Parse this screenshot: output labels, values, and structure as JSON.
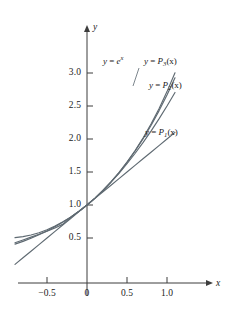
{
  "figure": {
    "background": "#ffffff",
    "curve_color": "#5f6a72",
    "axis_color": "#3d3d3d",
    "text_color": "#1b1b1b"
  },
  "axes": {
    "x_name": "x",
    "y_name": "y",
    "x_ticks": [
      {
        "value": -0.5,
        "label": "−0.5",
        "px": 47
      },
      {
        "value": 0,
        "label": "0",
        "px": 87
      },
      {
        "value": 0.5,
        "label": "0.5",
        "px": 127
      },
      {
        "value": 1.0,
        "label": "1.0",
        "px": 167
      }
    ],
    "y_ticks": [
      {
        "value": 0.5,
        "label": "0.5",
        "px": 238
      },
      {
        "value": 1.0,
        "label": "1.0",
        "px": 205
      },
      {
        "value": 1.5,
        "label": "1.5",
        "px": 172
      },
      {
        "value": 2.0,
        "label": "2.0",
        "px": 139
      },
      {
        "value": 2.5,
        "label": "2.5",
        "px": 106
      },
      {
        "value": 3.0,
        "label": "3.0",
        "px": 73
      }
    ]
  },
  "labels": {
    "exp": {
      "lhs": "y",
      "eq": "=",
      "base": "e",
      "exp": "x"
    },
    "p3": {
      "lhs": "y",
      "eq": "=",
      "fn": "P",
      "sub": "3",
      "arg": "(x)"
    },
    "p2": {
      "lhs": "y",
      "eq": "=",
      "fn": "P",
      "sub": "2",
      "arg": "(x)"
    },
    "p1": {
      "lhs": "y",
      "eq": "=",
      "fn": "P",
      "sub": "1",
      "arg": "(x)"
    }
  },
  "chart_data": {
    "type": "line",
    "title": "",
    "xlabel": "x",
    "ylabel": "y",
    "xlim": [
      -0.93,
      1.22
    ],
    "ylim": [
      0.0,
      3.25
    ],
    "grid": false,
    "legend": "inline-annotations",
    "x": [
      -0.9,
      -0.8,
      -0.7,
      -0.6,
      -0.5,
      -0.4,
      -0.3,
      -0.2,
      -0.1,
      0.0,
      0.1,
      0.2,
      0.3,
      0.4,
      0.5,
      0.6,
      0.7,
      0.8,
      0.9,
      1.0,
      1.1
    ],
    "series": [
      {
        "name": "y = e^x",
        "formula": "e^x",
        "color": "#5f6a72",
        "values": [
          0.407,
          0.449,
          0.497,
          0.549,
          0.607,
          0.67,
          0.741,
          0.819,
          0.905,
          1.0,
          1.105,
          1.221,
          1.35,
          1.492,
          1.649,
          1.822,
          2.014,
          2.226,
          2.46,
          2.718,
          3.004
        ]
      },
      {
        "name": "y = P3(x)",
        "formula": "1 + x + x^2/2 + x^3/6",
        "color": "#5f6a72",
        "values": [
          0.4285,
          0.4693,
          0.5128,
          0.556,
          0.6042,
          0.6507,
          0.7105,
          0.8187,
          0.9048,
          1.0,
          1.1052,
          1.2213,
          1.3495,
          1.4907,
          1.6458,
          1.816,
          2.0022,
          2.2053,
          2.4265,
          2.6667,
          2.9268
        ]
      },
      {
        "name": "y = P2(x)",
        "formula": "1 + x + x^2/2",
        "color": "#5f6a72",
        "values": [
          0.505,
          0.52,
          0.545,
          0.58,
          0.625,
          0.68,
          0.745,
          0.82,
          0.905,
          1.0,
          1.105,
          1.22,
          1.345,
          1.48,
          1.625,
          1.78,
          1.945,
          2.12,
          2.305,
          2.5,
          2.705
        ]
      },
      {
        "name": "y = P1(x)",
        "formula": "1 + x",
        "color": "#5f6a72",
        "values": [
          0.1,
          0.2,
          0.3,
          0.4,
          0.5,
          0.6,
          0.7,
          0.8,
          0.9,
          1.0,
          1.1,
          1.2,
          1.3,
          1.4,
          1.5,
          1.6,
          1.7,
          1.8,
          1.9,
          2.0,
          2.1
        ]
      }
    ],
    "annotations": [
      {
        "text": "y = e^x",
        "x": -0.02,
        "y": 2.8
      },
      {
        "text": "y = P3(x)",
        "x": 0.52,
        "y": 2.82
      },
      {
        "text": "y = P2(x)",
        "x": 0.62,
        "y": 2.45
      },
      {
        "text": "y = P1(x)",
        "x": 0.52,
        "y": 1.88
      }
    ]
  }
}
